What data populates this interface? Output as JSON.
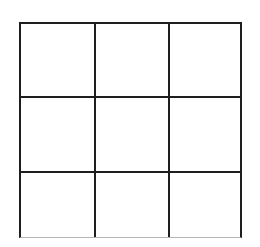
{
  "board": {
    "type": "empty-grid",
    "rows": 3,
    "columns": 3,
    "line_color": "#1e1e1e",
    "faded_bottom_edge_color": "#b5b5b5",
    "background_color": "#ffffff",
    "cells": [
      {
        "row": 1,
        "col": 1,
        "content": ""
      },
      {
        "row": 1,
        "col": 2,
        "content": ""
      },
      {
        "row": 1,
        "col": 3,
        "content": ""
      },
      {
        "row": 2,
        "col": 1,
        "content": ""
      },
      {
        "row": 2,
        "col": 2,
        "content": ""
      },
      {
        "row": 2,
        "col": 3,
        "content": ""
      },
      {
        "row": 3,
        "col": 1,
        "content": ""
      },
      {
        "row": 3,
        "col": 2,
        "content": ""
      },
      {
        "row": 3,
        "col": 3,
        "content": ""
      }
    ]
  }
}
